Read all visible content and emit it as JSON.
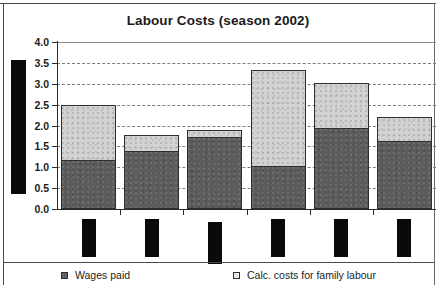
{
  "chart_data": {
    "type": "bar",
    "subtype": "stacked-bar",
    "title": "Labour Costs (season 2002)",
    "xlabel": "",
    "ylabel": "",
    "ylim": [
      0.0,
      4.0
    ],
    "ytick_labels": [
      "4.0",
      "3.5",
      "3.0",
      "2.5",
      "2.0",
      "1.5",
      "1.0",
      "0.5",
      "0.0"
    ],
    "ytick_values": [
      4.0,
      3.5,
      3.0,
      2.5,
      2.0,
      1.5,
      1.0,
      0.5,
      0.0
    ],
    "grid": "horizontal-dashed",
    "legend_position": "bottom",
    "categories": [
      "",
      "",
      "",
      "",
      "",
      ""
    ],
    "categories_redacted": true,
    "series": [
      {
        "name": "Wages paid",
        "color": "#5c5c5c",
        "values": [
          1.17,
          1.39,
          1.72,
          1.04,
          1.94,
          1.63
        ]
      },
      {
        "name": "Calc. costs for family labour",
        "color": "#d2d2d2",
        "values": [
          1.33,
          0.39,
          0.18,
          2.29,
          1.09,
          0.57
        ]
      }
    ],
    "totals": [
      2.5,
      1.78,
      1.9,
      3.33,
      3.03,
      2.2
    ]
  },
  "legend": {
    "items": [
      {
        "label": "Wages paid",
        "swatch": "dark"
      },
      {
        "label": "Calc. costs for family labour",
        "swatch": "light"
      }
    ]
  },
  "redactions": {
    "y_axis_title": "redaction-block-y-axis-title",
    "x_axis_labels": [
      "redaction-block-category-1",
      "redaction-block-category-2",
      "redaction-block-category-3",
      "redaction-block-category-4",
      "redaction-block-category-5",
      "redaction-block-category-6"
    ]
  }
}
